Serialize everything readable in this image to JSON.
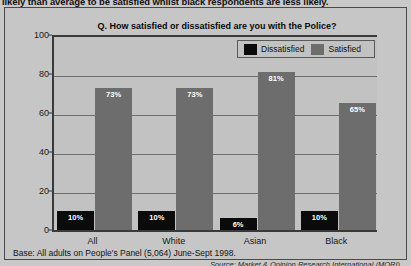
{
  "caption": "likely than average to be satisfied whilst black respondents are less likely.",
  "base_note": "Base: All adults on People's Panel (5,064) June-Sept 1998.",
  "source_note": "Source: Market & Opinion Research International (MORI)",
  "legend": {
    "dissatisfied_label": "Dissatisfied",
    "satisfied_label": "Satisfied",
    "dissatisfied_color": "#0b0b0b",
    "satisfied_color": "#6d6d6d"
  },
  "chart_data": {
    "type": "bar",
    "title": "Q. How satisfied or dissatisfied are you with the Police?",
    "xlabel": "",
    "ylabel": "",
    "ylim": [
      0,
      100
    ],
    "yticks": [
      0,
      20,
      40,
      60,
      80,
      100
    ],
    "grid": true,
    "legend_position": "top-right",
    "categories": [
      "All",
      "White",
      "Asian",
      "Black"
    ],
    "series": [
      {
        "name": "Dissatisfied",
        "color": "#0b0b0b",
        "values": [
          10,
          10,
          6,
          10
        ],
        "labels": [
          "10%",
          "10%",
          "6%",
          "10%"
        ]
      },
      {
        "name": "Satisfied",
        "color": "#6d6d6d",
        "values": [
          73,
          73,
          81,
          65
        ],
        "labels": [
          "73%",
          "73%",
          "81%",
          "65%"
        ]
      }
    ]
  }
}
